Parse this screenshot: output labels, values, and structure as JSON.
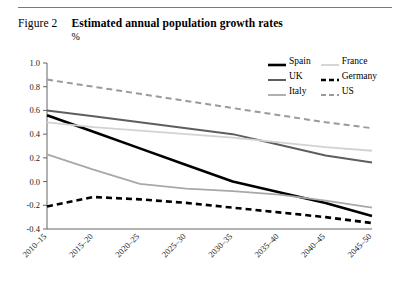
{
  "figure": {
    "label": "Figure 2",
    "title": "Estimated annual population growth rates",
    "unit": "%"
  },
  "legend": {
    "position": "top-right",
    "items": [
      {
        "name": "Spain",
        "color": "#000000",
        "style": "solid",
        "width": 2.6
      },
      {
        "name": "France",
        "color": "#d2d2d2",
        "style": "solid",
        "width": 1.8
      },
      {
        "name": "UK",
        "color": "#5e5e5e",
        "style": "solid",
        "width": 2.0
      },
      {
        "name": "Germany",
        "color": "#000000",
        "style": "dashed",
        "width": 2.6
      },
      {
        "name": "Italy",
        "color": "#a8a8a8",
        "style": "solid",
        "width": 1.8
      },
      {
        "name": "US",
        "color": "#9a9a9a",
        "style": "dashed",
        "width": 2.0
      }
    ]
  },
  "chart_data": {
    "type": "line",
    "title": "Estimated annual population growth rates",
    "xlabel": "",
    "ylabel": "%",
    "ylim": [
      -0.4,
      1.0
    ],
    "ytick_step": 0.2,
    "yticks": [
      "1.0",
      "0.8",
      "0.6",
      "0.4",
      "0.2",
      "0.0",
      "-0.2",
      "-0.4"
    ],
    "ytick_values": [
      1.0,
      0.8,
      0.6,
      0.4,
      0.2,
      0.0,
      -0.2,
      -0.4
    ],
    "grid": false,
    "categories": [
      "2010-15",
      "2015-20",
      "2020-25",
      "2025-30",
      "2030-35",
      "2035-40",
      "2040-45",
      "2045-50"
    ],
    "series": [
      {
        "name": "Spain",
        "color": "#000000",
        "style": "solid",
        "width": 2.6,
        "values": [
          0.56,
          0.42,
          0.28,
          0.14,
          0.0,
          -0.09,
          -0.18,
          -0.29
        ]
      },
      {
        "name": "UK",
        "color": "#5e5e5e",
        "style": "solid",
        "width": 2.0,
        "values": [
          0.6,
          0.55,
          0.5,
          0.45,
          0.4,
          0.31,
          0.22,
          0.16
        ]
      },
      {
        "name": "Italy",
        "color": "#a8a8a8",
        "style": "solid",
        "width": 1.8,
        "values": [
          0.23,
          0.1,
          -0.02,
          -0.06,
          -0.08,
          -0.11,
          -0.16,
          -0.22
        ]
      },
      {
        "name": "France",
        "color": "#d2d2d2",
        "style": "solid",
        "width": 1.8,
        "values": [
          0.5,
          0.46,
          0.43,
          0.4,
          0.37,
          0.33,
          0.29,
          0.26
        ]
      },
      {
        "name": "Germany",
        "color": "#000000",
        "style": "dashed",
        "width": 2.6,
        "values": [
          -0.21,
          -0.13,
          -0.15,
          -0.18,
          -0.22,
          -0.26,
          -0.3,
          -0.35
        ]
      },
      {
        "name": "US",
        "color": "#9a9a9a",
        "style": "dashed",
        "width": 2.0,
        "values": [
          0.86,
          0.8,
          0.74,
          0.68,
          0.62,
          0.56,
          0.5,
          0.45
        ]
      }
    ]
  }
}
